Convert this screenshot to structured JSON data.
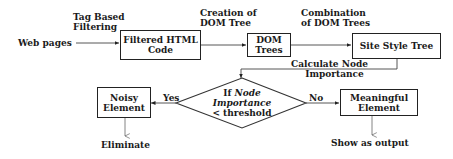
{
  "diagram": {
    "input_label": "Web pages",
    "edge_labels": {
      "tag_based_filtering": [
        "Tag Based",
        "Filtering"
      ],
      "creation_of_dom_tree": [
        "Creation of",
        "DOM Tree"
      ],
      "combination_of_dom_trees": [
        "Combination",
        "of DOM Trees"
      ],
      "calculate_node_importance": [
        "Calculate  Node",
        "Importance"
      ],
      "yes": "Yes",
      "no": "No"
    },
    "nodes": {
      "filtered_html": [
        "Filtered HTML",
        "Code"
      ],
      "dom_trees": [
        "DOM",
        "Trees"
      ],
      "site_style_tree": "Site Style Tree",
      "decision": {
        "line1_prefix": "If ",
        "line1_italic": "Node",
        "line2_italic": "Importance",
        "line3": "< threshold"
      },
      "noisy_element": [
        "Noisy",
        "Element"
      ],
      "meaningful_element": [
        "Meaningful",
        "Element"
      ]
    },
    "outputs": {
      "eliminate": "Eliminate",
      "show_as_output": "Show as output"
    }
  }
}
